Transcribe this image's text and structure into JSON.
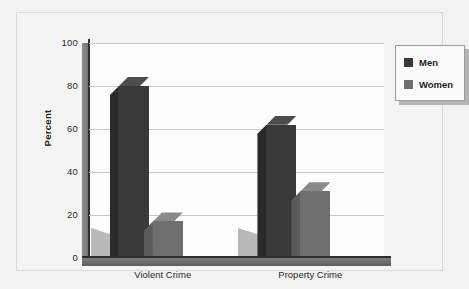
{
  "chart_data": {
    "type": "bar",
    "title": "",
    "subtitle": "",
    "xlabel": "",
    "ylabel": "Percent",
    "ylim": [
      0,
      100
    ],
    "ytick_values": [
      100,
      80,
      60,
      40,
      20,
      0
    ],
    "ytick_labels": [
      "100",
      "80",
      "60",
      "40",
      "20",
      "0"
    ],
    "categories": [
      "Violent Crime",
      "Property Crime"
    ],
    "grid": true,
    "legend_position": "top-right",
    "series": [
      {
        "name": "Men",
        "color": "#393939",
        "values": [
          80,
          62
        ]
      },
      {
        "name": "Women",
        "color": "#6e6e6e",
        "values": [
          17,
          31
        ]
      }
    ]
  },
  "legend": {
    "items": [
      {
        "label": "Men",
        "color": "#393939"
      },
      {
        "label": "Women",
        "color": "#6e6e6e"
      }
    ]
  },
  "axes": {
    "y": {
      "label": "Percent",
      "ticks": [
        "100",
        "80",
        "60",
        "40",
        "20",
        "0"
      ]
    },
    "x": {
      "ticks": [
        "Violent Crime",
        "Property Crime"
      ]
    }
  }
}
